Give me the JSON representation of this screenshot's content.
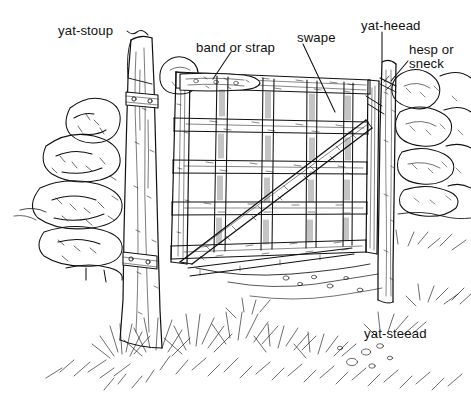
{
  "figure": {
    "kind": "line-drawing",
    "style": "pen-and-ink hatched illustration",
    "ink_color": "#111111",
    "background_color": "#ffffff"
  },
  "labels": [
    {
      "id": "yat-stoup",
      "text": "yat-stoup",
      "x": 58,
      "y": 24,
      "meaning": "hanging gate post"
    },
    {
      "id": "band-or-strap",
      "text": "band or strap",
      "x": 196,
      "y": 41,
      "meaning": "iron hinge strap on top rail"
    },
    {
      "id": "swape",
      "text": "swape",
      "x": 297,
      "y": 31,
      "meaning": "diagonal brace"
    },
    {
      "id": "yat-heead",
      "text": "yat-heead",
      "x": 361,
      "y": 19,
      "meaning": "closing gate post"
    },
    {
      "id": "hesp-or",
      "text": "hesp or",
      "x": 409,
      "y": 43,
      "meaning": "latch, line 1"
    },
    {
      "id": "sneck",
      "text": "sneck",
      "x": 409,
      "y": 57,
      "meaning": "latch, line 2"
    },
    {
      "id": "yat-steead",
      "text": "yat-steead",
      "x": 364,
      "y": 327,
      "meaning": "gateway / ground of the gate"
    }
  ],
  "leaders": [
    {
      "id": "leader-yat-stoup",
      "from": [
        128,
        33
      ],
      "to": [
        150,
        40
      ],
      "style": "wavy"
    },
    {
      "id": "leader-band-or-strap",
      "from": [
        230,
        53
      ],
      "to": [
        214,
        78
      ],
      "style": "straight"
    },
    {
      "id": "leader-swape",
      "from": [
        303,
        45
      ],
      "to": [
        334,
        110
      ],
      "style": "straight"
    },
    {
      "id": "leader-yat-heead",
      "from": [
        382,
        33
      ],
      "to": [
        382,
        62
      ],
      "style": "straight"
    },
    {
      "id": "leader-hesp-sneck",
      "from": [
        408,
        60
      ],
      "to": [
        392,
        80
      ],
      "style": "straight"
    }
  ]
}
